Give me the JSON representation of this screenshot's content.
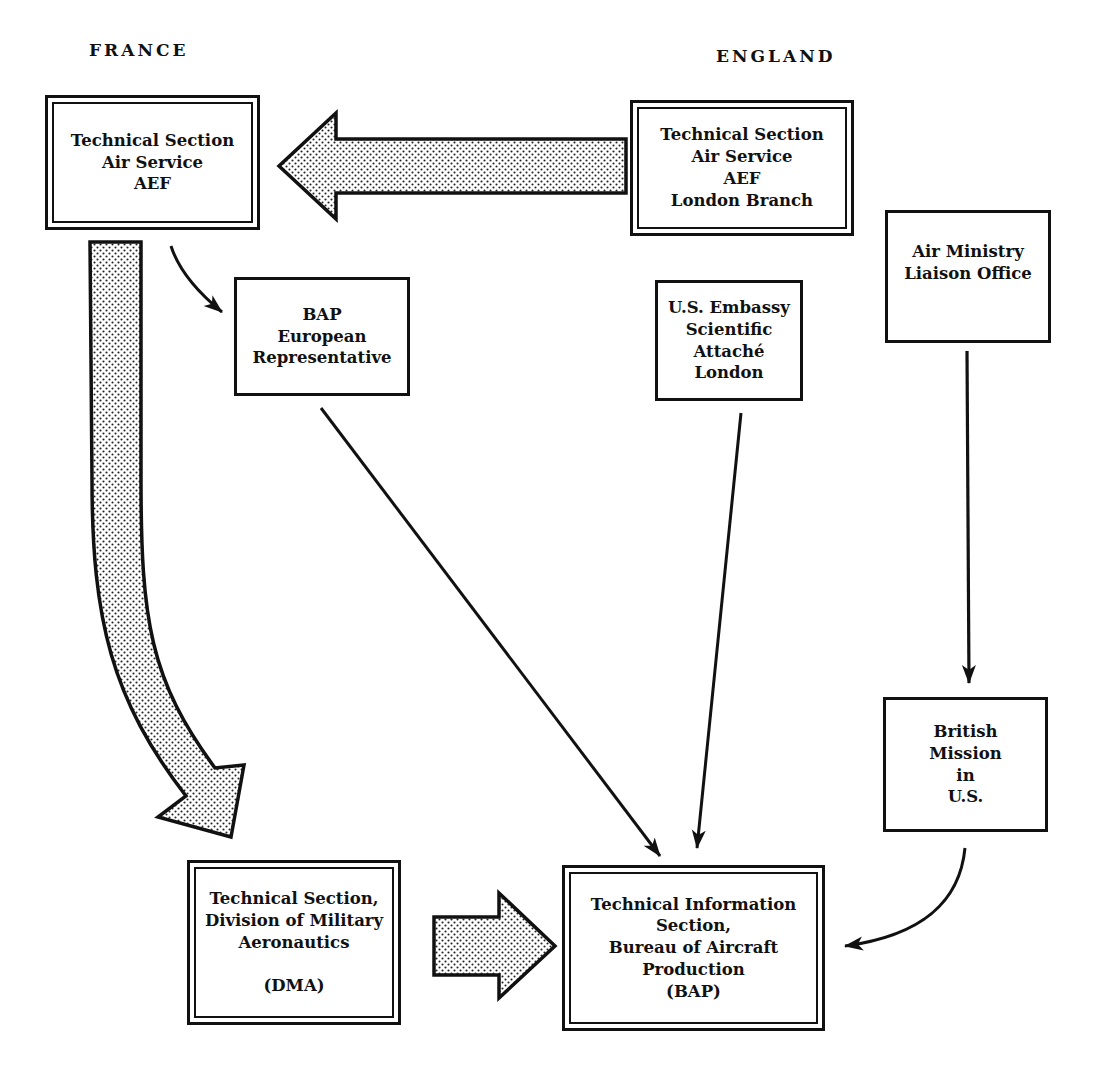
{
  "diagram": {
    "regions": {
      "france": "FRANCE",
      "england": "ENGLAND"
    },
    "nodes": {
      "tech_section_france": {
        "lines": [
          "Technical Section",
          "Air Service",
          "AEF"
        ],
        "border": "double"
      },
      "tech_section_london": {
        "lines": [
          "Technical Section",
          "Air Service",
          "AEF",
          "London Branch"
        ],
        "border": "double"
      },
      "air_ministry": {
        "lines": [
          "Air Ministry",
          "Liaison Office"
        ],
        "border": "single"
      },
      "bap_european_rep": {
        "lines": [
          "BAP",
          "European",
          "Representative"
        ],
        "border": "single"
      },
      "us_embassy": {
        "lines": [
          "U.S. Embassy",
          "Scientific",
          "Attaché",
          "London"
        ],
        "border": "single"
      },
      "british_mission": {
        "lines": [
          "British",
          "Mission",
          "in",
          "U.S."
        ],
        "border": "single"
      },
      "dma": {
        "lines": [
          "Technical Section,",
          "Division of Military",
          "Aeronautics",
          "(DMA)"
        ],
        "border": "double"
      },
      "tech_info_bap": {
        "lines": [
          "Technical Information",
          "Section,",
          "Bureau of Aircraft",
          "Production",
          "(BAP)"
        ],
        "border": "double"
      }
    },
    "edges": [
      {
        "from": "tech_section_london",
        "to": "tech_section_france",
        "style": "wide-stippled-arrow"
      },
      {
        "from": "tech_section_france",
        "to": "dma",
        "style": "wide-stippled-curved-arrow"
      },
      {
        "from": "tech_section_france",
        "to": "bap_european_rep",
        "style": "thin-curved-arrow"
      },
      {
        "from": "dma",
        "to": "tech_info_bap",
        "style": "wide-stippled-arrow"
      },
      {
        "from": "bap_european_rep",
        "to": "tech_info_bap",
        "style": "thin-arrow"
      },
      {
        "from": "us_embassy",
        "to": "tech_info_bap",
        "style": "thin-arrow"
      },
      {
        "from": "air_ministry",
        "to": "british_mission",
        "style": "thin-arrow"
      },
      {
        "from": "british_mission",
        "to": "tech_info_bap",
        "style": "thin-curved-arrow"
      }
    ],
    "colors": {
      "ink": "#111111",
      "paper": "#ffffff",
      "stipple": "#cfcfcf"
    }
  }
}
